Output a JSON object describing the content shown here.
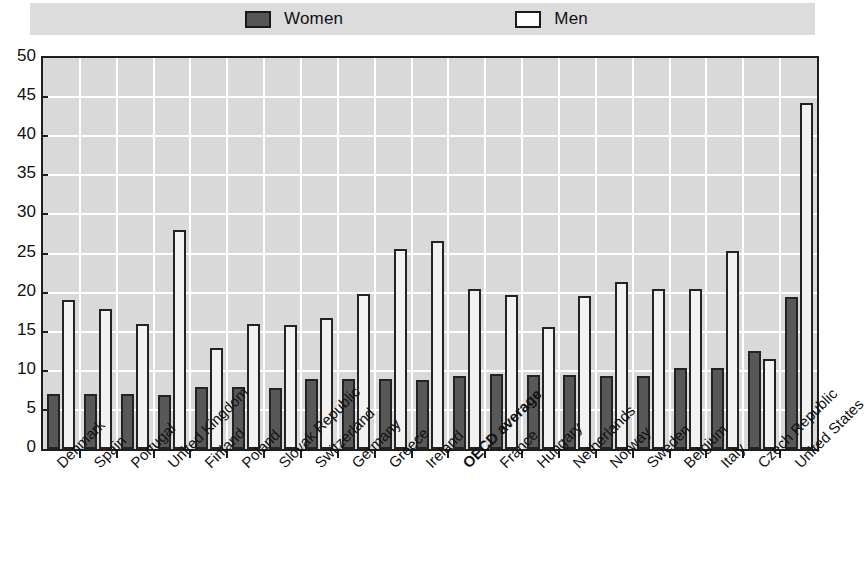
{
  "legend": {
    "entries": [
      {
        "key": "women",
        "label": "Women",
        "swatch": "filled-dark-square",
        "color": "#555555"
      },
      {
        "key": "men",
        "label": "Men",
        "swatch": "open-white-square",
        "color": "#ffffff"
      }
    ]
  },
  "axes": {
    "y_ticks": [
      "0",
      "5",
      "10",
      "15",
      "20",
      "25",
      "30",
      "35",
      "40",
      "45",
      "50"
    ]
  },
  "chart_data": {
    "type": "bar",
    "title": "",
    "subtitle": "",
    "xlabel": "",
    "ylabel": "",
    "ylim": [
      0,
      50
    ],
    "ytick_step": 5,
    "grid": true,
    "legend_position": "top-center",
    "orientation": "vertical",
    "categories": [
      "Denmark",
      "Spain",
      "Portugal",
      "United Kingdom",
      "Finland",
      "Poland",
      "Slovak Republic",
      "Switzerland",
      "Germany",
      "Greece",
      "Ireland",
      "OECD average",
      "France",
      "Hungary",
      "Netherlands",
      "Norway",
      "Sweden",
      "Belgium",
      "Italy",
      "Czech Republic",
      "United States"
    ],
    "emphasized_categories": [
      "OECD average"
    ],
    "series": [
      {
        "name": "Women",
        "color": "#585858",
        "values": [
          7.0,
          7.0,
          7.0,
          6.9,
          7.9,
          7.9,
          7.8,
          8.9,
          8.9,
          8.9,
          8.8,
          9.3,
          9.6,
          9.5,
          9.5,
          9.4,
          9.4,
          10.4,
          10.4,
          12.5,
          19.5
        ]
      },
      {
        "name": "Men",
        "color": "#f2f2f2",
        "values": [
          19.0,
          17.9,
          16.0,
          28.0,
          12.9,
          16.0,
          15.9,
          16.8,
          19.8,
          25.6,
          26.6,
          20.5,
          19.7,
          15.6,
          19.6,
          21.4,
          20.5,
          20.5,
          25.3,
          11.5,
          44.2
        ]
      }
    ]
  }
}
